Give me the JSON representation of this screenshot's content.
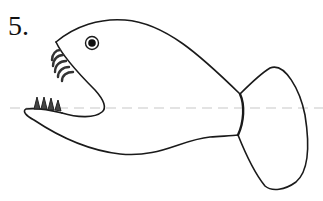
{
  "figure": {
    "number_label": "5.",
    "colors": {
      "outline": "#1a1a1a",
      "guide_line": "#c8c8c8",
      "background": "#ffffff"
    },
    "guide_line": {
      "style": "dashed",
      "y": 108
    }
  }
}
